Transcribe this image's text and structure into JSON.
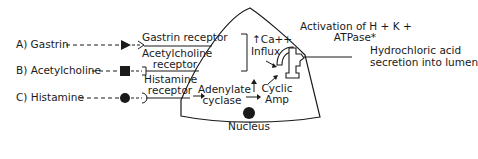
{
  "diagram": {
    "type": "parietal-cell-acid-secretion",
    "stimuli": [
      {
        "id": "A",
        "label": "A) Gastrin",
        "receptor": "Gastrin receptor",
        "receptor_shape": "triangle"
      },
      {
        "id": "B",
        "label": "B) Acetylcholine",
        "receptor": "Acetylcholine receptor",
        "receptor_shape": "square"
      },
      {
        "id": "C",
        "label": "C) Histamine",
        "receptor": "Histamine receptor",
        "receptor_shape": "circle"
      }
    ],
    "receptor_labels": {
      "gastrin": "Gastrin receptor",
      "acetylcholine_line1": "Acetylcholine",
      "acetylcholine_line2": "receptor",
      "histamine_line1": "Histamine",
      "histamine_line2": "receptor"
    },
    "intracellular": {
      "ca_line1": "↑Ca++",
      "ca_line2": "Influx",
      "adenylate_line1": "Adenylate",
      "adenylate_line2": "cyclase",
      "camp_line1": "Cyclic",
      "camp_line2": "Amp",
      "nucleus": "Nucleus"
    },
    "pump": {
      "line1": "Activation of H + K +",
      "line2": "ATPase*"
    },
    "output": {
      "line1": "Hydrochloric acid",
      "line2": "secretion into lumen"
    },
    "colors": {
      "line": "#1a1a1a",
      "background": "#ffffff"
    }
  }
}
